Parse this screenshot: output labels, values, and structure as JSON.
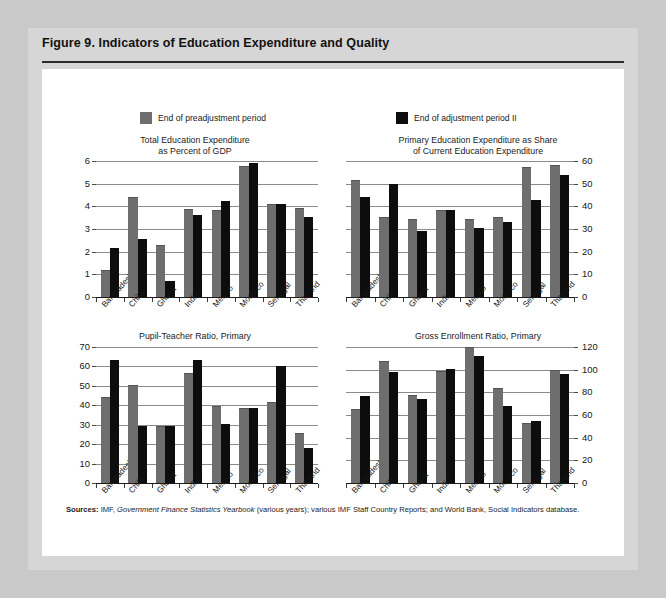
{
  "figure": {
    "title": "Figure 9.  Indicators of Education Expenditure and Quality",
    "source_lead": "Sources:",
    "source_part1": "IMF,",
    "source_italic": "Government Finance Statistics Yearbook",
    "source_part2": "(various years); various IMF Staff Country Reports; and World Bank, Social Indicators database."
  },
  "legend": {
    "series": [
      {
        "label": "End of preadjustment period",
        "color": "#6e6e6e",
        "swatch": "gray-square-icon"
      },
      {
        "label": "End of adjustment period II",
        "color": "#0d0d0d",
        "swatch": "black-square-icon"
      }
    ]
  },
  "colors": {
    "preadjustment": "#6e6e6e",
    "adjustment_ii": "#0d0d0d",
    "gridline": "#8a8a8a",
    "page_background": "#c9c9c9",
    "frame_background": "#d6d6d6",
    "canvas_background": "#ffffff"
  },
  "chart_data": [
    {
      "id": "total-education-expenditure",
      "type": "bar",
      "title": "Total Education Expenditure\nas Percent of GDP",
      "title_line1": "Total Education Expenditure",
      "title_line2": "as Percent of GDP",
      "xlabel": "",
      "ylabel": "",
      "axis_position": "left",
      "ylim": [
        0,
        6
      ],
      "yticks": [
        0,
        1,
        2,
        3,
        4,
        5,
        6
      ],
      "ytick_labels": [
        "0",
        "1",
        "2",
        "3",
        "4",
        "5",
        "6"
      ],
      "grid": true,
      "legend_position": "top",
      "categories": [
        "Bangladesh",
        "Chile",
        "Ghana",
        "India",
        "Mexico",
        "Morocco",
        "Senegal",
        "Thailand"
      ],
      "series": [
        {
          "name": "End of preadjustment period",
          "color": "#6e6e6e",
          "values": [
            1.15,
            4.35,
            2.25,
            3.85,
            3.8,
            5.75,
            4.05,
            3.9
          ]
        },
        {
          "name": "End of adjustment period II",
          "color": "#0d0d0d",
          "values": [
            2.15,
            2.55,
            0.7,
            3.6,
            4.25,
            5.9,
            4.1,
            3.55
          ]
        }
      ]
    },
    {
      "id": "primary-share-of-current-expenditure",
      "type": "bar",
      "title": "Primary Education Expenditure as Share\nof Current Education Expenditure",
      "title_line1": "Primary Education Expenditure as Share",
      "title_line2": "of Current Education Expenditure",
      "xlabel": "",
      "ylabel": "",
      "axis_position": "right",
      "ylim": [
        0,
        60
      ],
      "yticks": [
        0,
        10,
        20,
        30,
        40,
        50,
        60
      ],
      "ytick_labels": [
        "0",
        "10",
        "20",
        "30",
        "40",
        "50",
        "60"
      ],
      "grid": true,
      "legend_position": "top",
      "categories": [
        "Bangladesh",
        "Chile",
        "Ghana",
        "India",
        "Mexico",
        "Morocco",
        "Senegal",
        "Thailand"
      ],
      "series": [
        {
          "name": "End of preadjustment period",
          "color": "#6e6e6e",
          "values": [
            51,
            35,
            34,
            38,
            34,
            35,
            57,
            58
          ]
        },
        {
          "name": "End of adjustment period II",
          "color": "#0d0d0d",
          "values": [
            44,
            50,
            29,
            38.5,
            30.5,
            33,
            43,
            54
          ]
        }
      ]
    },
    {
      "id": "pupil-teacher-ratio-primary",
      "type": "bar",
      "title": "Pupil-Teacher Ratio, Primary",
      "title_line1": "Pupil-Teacher Ratio, Primary",
      "title_line2": "",
      "xlabel": "",
      "ylabel": "",
      "axis_position": "left",
      "ylim": [
        0,
        70
      ],
      "yticks": [
        0,
        10,
        20,
        30,
        40,
        50,
        60,
        70
      ],
      "ytick_labels": [
        "0",
        "10",
        "20",
        "30",
        "40",
        "50",
        "60",
        "70"
      ],
      "grid": true,
      "legend_position": "top",
      "categories": [
        "Bangladesh",
        "Chile",
        "Ghana",
        "India",
        "Mexico",
        "Morocco",
        "Senegal",
        "Thailand"
      ],
      "series": [
        {
          "name": "End of preadjustment period",
          "color": "#6e6e6e",
          "values": [
            44,
            50,
            29,
            56,
            39,
            38,
            41,
            25
          ]
        },
        {
          "name": "End of adjustment period II",
          "color": "#0d0d0d",
          "values": [
            63.5,
            29.5,
            29.5,
            63.5,
            30.5,
            38.5,
            60,
            18
          ]
        }
      ]
    },
    {
      "id": "gross-enrollment-ratio-primary",
      "type": "bar",
      "title": "Gross Enrollment Ratio, Primary",
      "title_line1": "Gross Enrollment Ratio, Primary",
      "title_line2": "",
      "xlabel": "",
      "ylabel": "",
      "axis_position": "right",
      "ylim": [
        0,
        120
      ],
      "yticks": [
        0,
        20,
        40,
        60,
        80,
        100,
        120
      ],
      "ytick_labels": [
        "0",
        "20",
        "40",
        "60",
        "80",
        "100",
        "120"
      ],
      "grid": true,
      "legend_position": "top",
      "categories": [
        "Bangladesh",
        "Chile",
        "Ghana",
        "India",
        "Mexico",
        "Morocco",
        "Senegal",
        "Thailand"
      ],
      "series": [
        {
          "name": "End of preadjustment period",
          "color": "#6e6e6e",
          "values": [
            64,
            107,
            77,
            98,
            119,
            83,
            52,
            99
          ]
        },
        {
          "name": "End of adjustment period II",
          "color": "#0d0d0d",
          "values": [
            77,
            98,
            74,
            101,
            112,
            68,
            55,
            96
          ]
        }
      ]
    }
  ]
}
